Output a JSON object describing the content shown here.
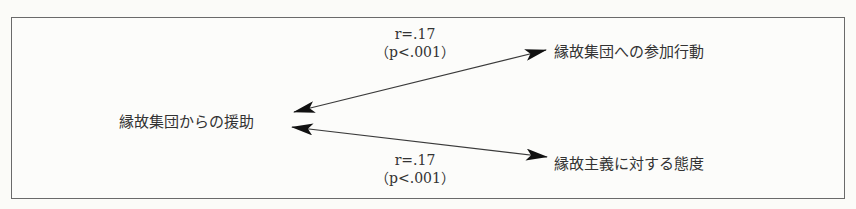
{
  "diagram": {
    "nodes": {
      "source": "縁故集団からの援助",
      "target_top": "縁故集団への参加行動",
      "target_bottom": "縁故主義に対する態度"
    },
    "edges": [
      {
        "from": "縁故集団からの援助",
        "to": "縁故集団への参加行動",
        "r_label": "r=.17",
        "p_label": "（p<.001）",
        "type": "bidirectional"
      },
      {
        "from": "縁故集団からの援助",
        "to": "縁故主義に対する態度",
        "r_label": "r=.17",
        "p_label": "（p<.001）",
        "type": "bidirectional"
      }
    ],
    "colors": {
      "line": "#3a3a3a",
      "arrowhead": "#111111",
      "border": "#6a6a6a",
      "background": "#fbfbf8"
    }
  }
}
